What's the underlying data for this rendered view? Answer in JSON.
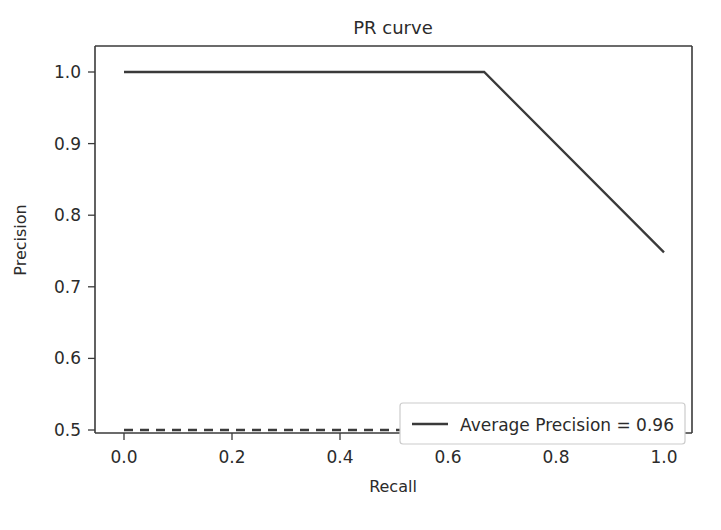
{
  "chart_data": {
    "type": "line",
    "title": "PR curve",
    "xlabel": "Recall",
    "ylabel": "Precision",
    "xlim": [
      -0.05,
      1.05
    ],
    "ylim": [
      0.4875,
      1.0125
    ],
    "grid": false,
    "legend_position": "lower right",
    "xticks": [
      "0.0",
      "0.2",
      "0.4",
      "0.6",
      "0.8",
      "1.0"
    ],
    "xtick_values": [
      0.0,
      0.2,
      0.4,
      0.6,
      0.8,
      1.0
    ],
    "yticks": [
      "0.5",
      "0.6",
      "0.7",
      "0.8",
      "0.9",
      "1.0"
    ],
    "ytick_values": [
      0.5,
      0.6,
      0.7,
      0.8,
      0.9,
      1.0
    ],
    "series": [
      {
        "name": "Average Precision = 0.96",
        "style": "solid",
        "color": "#3a3a3a",
        "x": [
          0.0,
          0.667,
          1.0
        ],
        "values": [
          1.0,
          1.0,
          0.748
        ]
      },
      {
        "name": "baseline",
        "style": "dashed",
        "color": "#3a3a3a",
        "x": [
          0.0,
          1.0
        ],
        "values": [
          0.5,
          0.5
        ],
        "in_legend": false
      }
    ],
    "annotations": []
  },
  "legend": {
    "entries": [
      {
        "label": "Average Precision = 0.96",
        "swatch_color": "#3a3a3a",
        "swatch_style": "solid"
      }
    ]
  },
  "colors": {
    "line": "#3a3a3a",
    "axis": "#3a3a3a",
    "text": "#2b2b2b",
    "background": "#ffffff",
    "legend_border": "#cccccc",
    "legend_background": "#ffffff"
  }
}
